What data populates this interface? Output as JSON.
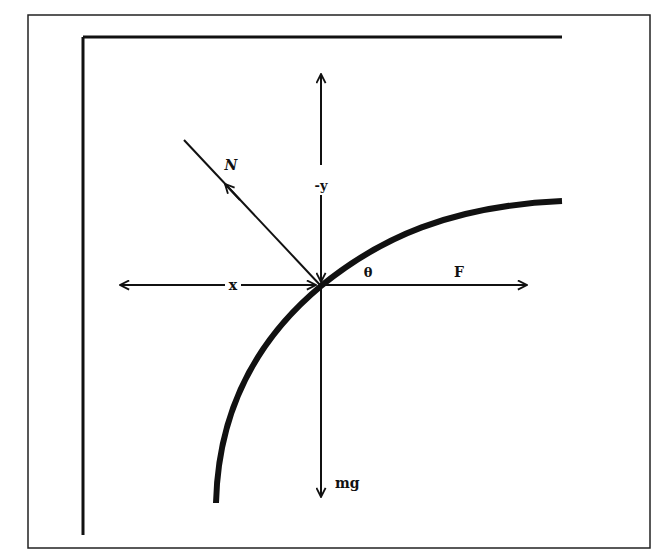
{
  "diagram": {
    "type": "free-body-diagram",
    "colors": {
      "ink": "#111111",
      "background": "#ffffff"
    },
    "labels": {
      "normal_force": "N",
      "neg_y_axis": "-y",
      "x_axis": "x",
      "angle": "θ",
      "applied_force": "F",
      "weight": "mg"
    },
    "forces": [
      {
        "name": "N",
        "direction": "up-left, perpendicular to surface"
      },
      {
        "name": "F",
        "direction": "right (horizontal)"
      },
      {
        "name": "mg",
        "direction": "down"
      }
    ],
    "axes": [
      {
        "name": "x",
        "direction": "horizontal, double-headed"
      },
      {
        "name": "-y",
        "direction": "vertical, pointing up"
      }
    ],
    "angle": {
      "name": "θ",
      "between": "curved surface tangent and horizontal F"
    }
  }
}
